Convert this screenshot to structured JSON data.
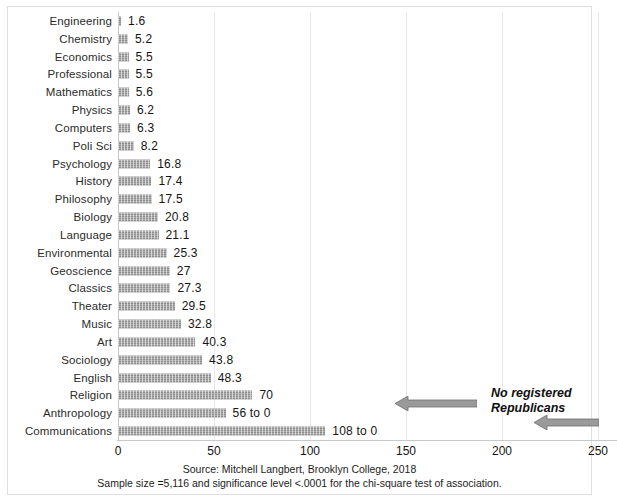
{
  "chart_data": {
    "type": "bar",
    "orientation": "horizontal",
    "title": "",
    "xlabel": "",
    "ylabel": "",
    "xlim": [
      0,
      250
    ],
    "xticks": [
      0,
      50,
      100,
      150,
      200,
      250
    ],
    "grid": true,
    "legend": "none",
    "bar_color": "#8d8d8d",
    "categories": [
      "Engineering",
      "Chemistry",
      "Economics",
      "Professional",
      "Mathematics",
      "Physics",
      "Computers",
      "Poli Sci",
      "Psychology",
      "History",
      "Philosophy",
      "Biology",
      "Language",
      "Environmental",
      "Geoscience",
      "Classics",
      "Theater",
      "Music",
      "Art",
      "Sociology",
      "English",
      "Religion",
      "Anthropology",
      "Communications"
    ],
    "values": [
      1.6,
      5.2,
      5.5,
      5.5,
      5.6,
      6.2,
      6.3,
      8.2,
      16.8,
      17.4,
      17.5,
      20.8,
      21.1,
      25.3,
      27,
      27.3,
      29.5,
      32.8,
      40.3,
      43.8,
      48.3,
      70,
      56,
      108
    ],
    "value_labels": [
      "1.6",
      "5.2",
      "5.5",
      "5.5",
      "5.6",
      "6.2",
      "6.3",
      "8.2",
      "16.8",
      "17.4",
      "17.5",
      "20.8",
      "21.1",
      "25.3",
      "27",
      "27.3",
      "29.5",
      "32.8",
      "40.3",
      "43.8",
      "48.3",
      "70",
      "56 to 0",
      "108 to 0"
    ],
    "annotations": [
      {
        "text_line1": "No registered",
        "text_line2": "Republicans",
        "arrows": 2,
        "arrow_direction": "left"
      }
    ]
  },
  "footer": {
    "source_line": "Source: Mitchell Langbert, Brooklyn College, 2018",
    "note_line": "Sample size =5,116 and significance level <.0001 for the chi-square test of association."
  }
}
